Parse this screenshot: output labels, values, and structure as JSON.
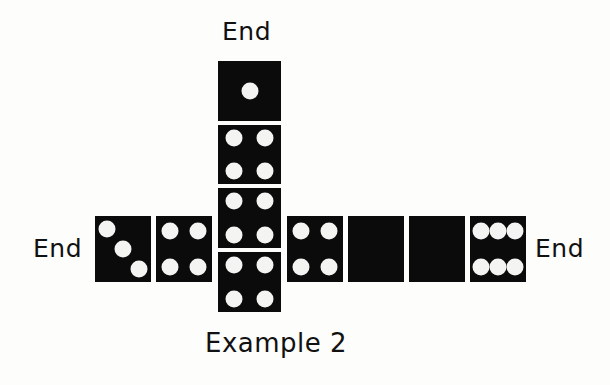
{
  "labels": {
    "end_top": "End",
    "end_left": "End",
    "end_right": "End",
    "caption": "Example 2"
  },
  "colors": {
    "tile": "#0b0b0b",
    "pip": "#f4f4f2",
    "background": "#fdfdfb",
    "text": "#111111"
  },
  "tiles": [
    {
      "id": "top-1",
      "pips": 1,
      "orientation": "column",
      "x": 218,
      "y": 61,
      "w": 63,
      "h": 60
    },
    {
      "id": "column-4a",
      "pips": 4,
      "orientation": "column",
      "x": 218,
      "y": 125,
      "w": 63,
      "h": 59
    },
    {
      "id": "column-4b",
      "pips": 4,
      "orientation": "column",
      "x": 218,
      "y": 188,
      "w": 63,
      "h": 60
    },
    {
      "id": "column-4c",
      "pips": 4,
      "orientation": "column",
      "x": 218,
      "y": 252,
      "w": 63,
      "h": 60
    },
    {
      "id": "left-3",
      "pips": 3,
      "orientation": "row",
      "x": 95,
      "y": 216,
      "w": 56,
      "h": 66
    },
    {
      "id": "left-4",
      "pips": 4,
      "orientation": "row",
      "x": 156,
      "y": 216,
      "w": 56,
      "h": 66
    },
    {
      "id": "right-4",
      "pips": 4,
      "orientation": "row",
      "x": 287,
      "y": 216,
      "w": 56,
      "h": 66
    },
    {
      "id": "right-blank-a",
      "pips": 0,
      "orientation": "row",
      "x": 348,
      "y": 216,
      "w": 56,
      "h": 66
    },
    {
      "id": "right-blank-b",
      "pips": 0,
      "orientation": "row",
      "x": 409,
      "y": 216,
      "w": 56,
      "h": 66
    },
    {
      "id": "right-6",
      "pips": 6,
      "orientation": "row",
      "x": 470,
      "y": 216,
      "w": 56,
      "h": 66
    }
  ]
}
